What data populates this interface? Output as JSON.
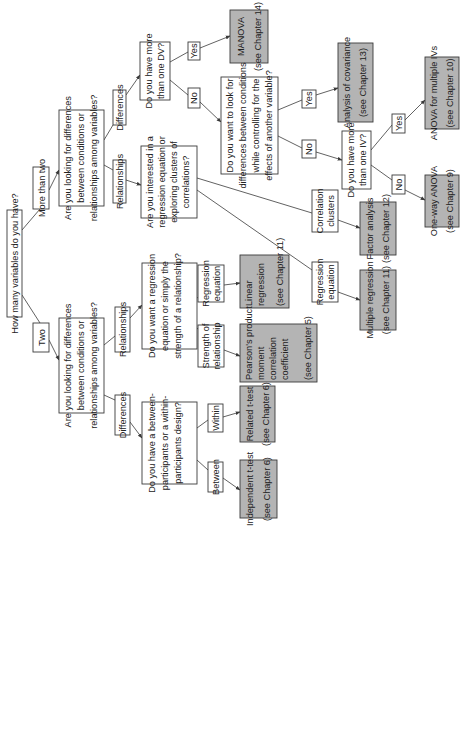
{
  "diagram": {
    "orientation": "rotated -90deg",
    "colors": {
      "question_fill": "#ffffff",
      "result_fill": "#b4b4b4",
      "stroke": "#3a3a3a"
    },
    "nodes": {
      "root": {
        "lines": [
          "How many variables do you have?"
        ]
      },
      "more_than_two": {
        "lines": [
          "More than two"
        ]
      },
      "two": {
        "lines": [
          "Two"
        ]
      },
      "q_more": {
        "lines": [
          "Are you looking for differences",
          "between conditions or",
          "relationships among variables?"
        ]
      },
      "q_two": {
        "lines": [
          "Are you looking for differences",
          "between conditions or",
          "relationships among variables?"
        ]
      },
      "diff_more": {
        "lines": [
          "Differences"
        ]
      },
      "rel_more": {
        "lines": [
          "Relationships"
        ]
      },
      "q_dv": {
        "lines": [
          "Do you have more",
          "than one DV?"
        ]
      },
      "q_interest": {
        "lines": [
          "Are you interested in a",
          "regression equation or",
          "exploring clusters of",
          "correlations?"
        ]
      },
      "yes_dv": {
        "lines": [
          "Yes"
        ]
      },
      "no_dv": {
        "lines": [
          "No"
        ]
      },
      "manova": {
        "lines": [
          "MANOVA",
          "(see Chapter 14)"
        ]
      },
      "q_cov": {
        "lines": [
          "Do you want to look for",
          "differences between conditions",
          "while controlling for the",
          "effects of another variable?"
        ]
      },
      "yes_cov": {
        "lines": [
          "Yes"
        ]
      },
      "no_cov": {
        "lines": [
          "No"
        ]
      },
      "ancova": {
        "lines": [
          "Analysis of covariance",
          "(see Chapter 13)"
        ]
      },
      "q_iv": {
        "lines": [
          "Do you have more",
          "than one IV?"
        ]
      },
      "yes_iv": {
        "lines": [
          "Yes"
        ]
      },
      "no_iv": {
        "lines": [
          "No"
        ]
      },
      "anova_multi": {
        "lines": [
          "ANOVA for multiple IVs",
          "(see Chapter 10)"
        ]
      },
      "oneway": {
        "lines": [
          "One-way ANOVA",
          "(see Chapter 9)"
        ]
      },
      "corr_clusters": {
        "lines": [
          "Correlation",
          "clusters"
        ]
      },
      "factor": {
        "lines": [
          "Factor analysis",
          "(see Chapter 12)"
        ]
      },
      "reg_eq_more": {
        "lines": [
          "Regression",
          "equation"
        ]
      },
      "multiple_reg": {
        "lines": [
          "Multiple regression",
          "(see Chapter 11)"
        ]
      },
      "rel_two": {
        "lines": [
          "Relationships"
        ]
      },
      "diff_two": {
        "lines": [
          "Differences"
        ]
      },
      "q_reg": {
        "lines": [
          "Do you want a regression",
          "equation or simply the",
          "strength of a relationship?"
        ]
      },
      "reg_eq_two": {
        "lines": [
          "Regression",
          "equation"
        ]
      },
      "strength": {
        "lines": [
          "Strength of",
          "relationship"
        ]
      },
      "linear": {
        "lines": [
          "Linear",
          "regression",
          "(see Chapter 11)"
        ]
      },
      "pearson": {
        "lines": [
          "Pearson's product",
          "moment",
          "correlation",
          "coefficient",
          "(see Chapter 5)"
        ]
      },
      "q_design": {
        "lines": [
          "Do you have a between-",
          "participants or a within-",
          "participants design?"
        ]
      },
      "within": {
        "lines": [
          "Within"
        ]
      },
      "between": {
        "lines": [
          "Between"
        ]
      },
      "related": {
        "lines": [
          "Related t-test",
          "(see Chapter 6)"
        ]
      },
      "independent": {
        "lines": [
          "Independent t-test",
          "(see Chapter 6)"
        ]
      }
    }
  }
}
